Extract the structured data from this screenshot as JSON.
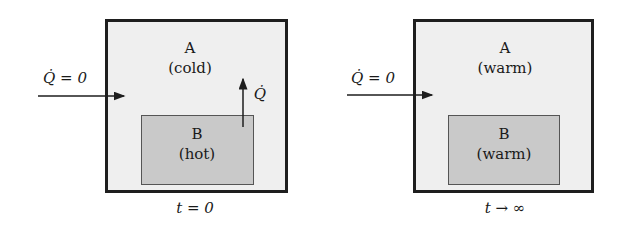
{
  "panels": [
    {
      "region_a": {
        "name": "A",
        "state": "(cold)"
      },
      "region_b": {
        "name": "B",
        "state": "(hot)"
      },
      "boundary_heat": "Q̇ = 0",
      "internal_heat": "Q̇",
      "time_label": "t = 0"
    },
    {
      "region_a": {
        "name": "A",
        "state": "(warm)"
      },
      "region_b": {
        "name": "B",
        "state": "(warm)"
      },
      "boundary_heat": "Q̇ = 0",
      "time_label": "t → ∞"
    }
  ],
  "colors": {
    "outer_fill": "#efefef",
    "inner_fill": "#c9c9c9",
    "border": "#1e1e1e"
  }
}
